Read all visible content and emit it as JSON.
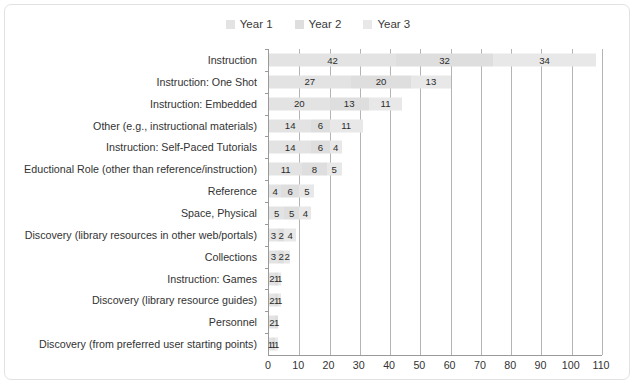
{
  "chart_data": {
    "type": "bar",
    "orientation": "horizontal",
    "stacked": true,
    "title": "",
    "xlabel": "",
    "ylabel": "",
    "xlim": [
      0,
      110
    ],
    "xticks": [
      0,
      10,
      20,
      30,
      40,
      50,
      60,
      70,
      80,
      90,
      100,
      110
    ],
    "grid": true,
    "legend_position": "top-center",
    "legend": [
      "Year 1",
      "Year 2",
      "Year 3"
    ],
    "categories": [
      "Instruction",
      "Instruction: One Shot",
      "Instruction: Embedded",
      "Other (e.g., instructional materials)",
      "Instruction: Self-Paced Tutorials",
      "Eductional Role (other than reference/instruction)",
      "Reference",
      "Space, Physical",
      "Discovery (library resources in other web/portals)",
      "Collections",
      "Instruction: Games",
      "Discovery (library resource guides)",
      "Personnel",
      "Discovery (from preferred user starting points)"
    ],
    "series": [
      {
        "name": "Year 1",
        "values": [
          42,
          27,
          20,
          14,
          14,
          11,
          4,
          5,
          3,
          3,
          2,
          2,
          2,
          1
        ]
      },
      {
        "name": "Year 2",
        "values": [
          32,
          20,
          13,
          6,
          6,
          8,
          6,
          5,
          2,
          2,
          1,
          1,
          1,
          1
        ]
      },
      {
        "name": "Year 3",
        "values": [
          34,
          13,
          11,
          11,
          4,
          5,
          5,
          4,
          4,
          2,
          1,
          1,
          0,
          1
        ]
      }
    ],
    "totals": [
      108,
      60,
      44,
      31,
      24,
      24,
      15,
      14,
      9,
      7,
      4,
      4,
      3,
      3
    ],
    "colors": {
      "year1": "#e3e3e3",
      "year2": "#dedede",
      "year3": "#e8e8e8",
      "gridline": "#b4b4b4",
      "axis": "#9a9a9a",
      "text": "#333333",
      "border": "#e2e2e2",
      "background": "#ffffff"
    }
  }
}
